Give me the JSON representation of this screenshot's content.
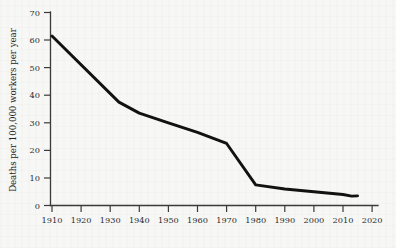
{
  "figure": {
    "background_color": "#f7f7f6",
    "line_color": "#121212",
    "axis_color": "#3a3a3a"
  },
  "chart_data": {
    "type": "line",
    "title": "",
    "xlabel": "",
    "ylabel": "Deaths per 100,000 workers per year",
    "xlim": [
      1910,
      2020
    ],
    "ylim": [
      0,
      70
    ],
    "grid": false,
    "legend": "none",
    "xticks": [
      1910,
      1920,
      1930,
      1940,
      1950,
      1960,
      1970,
      1980,
      1990,
      2000,
      2010,
      2020
    ],
    "yticks": [
      0,
      10,
      20,
      30,
      40,
      50,
      60,
      70
    ],
    "xtick_labels": [
      "1910",
      "1920",
      "1930",
      "1940",
      "1950",
      "1960",
      "1970",
      "1980",
      "1990",
      "2000",
      "2010",
      "2020"
    ],
    "ytick_labels": [
      "0",
      "10",
      "20",
      "30",
      "40",
      "50",
      "60",
      "70"
    ],
    "series": [
      {
        "name": "Workplace death rate",
        "x": [
          1910,
          1933,
          1940,
          1950,
          1960,
          1970,
          1980,
          1990,
          2000,
          2010,
          2013,
          2015
        ],
        "values": [
          61.5,
          37.5,
          33.5,
          30.0,
          26.5,
          22.5,
          7.5,
          6.0,
          5.0,
          4.0,
          3.4,
          3.5
        ]
      }
    ]
  }
}
